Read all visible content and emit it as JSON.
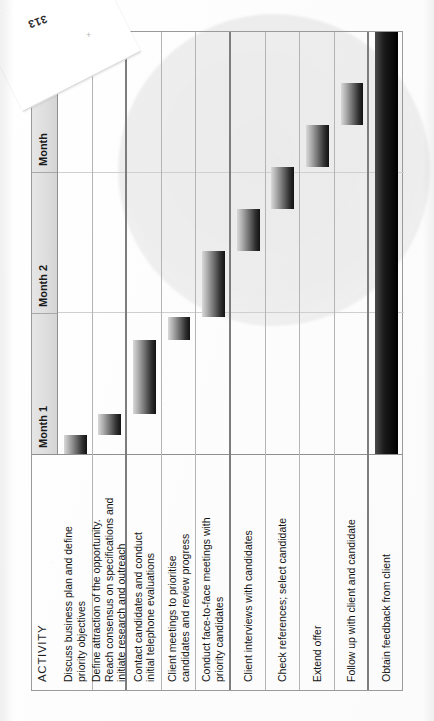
{
  "page": {
    "folio": "313",
    "registration_mark": "+"
  },
  "chart_data": {
    "type": "bar",
    "chart_kind": "gantt",
    "title": "",
    "xlabel": "",
    "ylabel": "ACTIVITY",
    "grid": true,
    "legend": "none",
    "orientation": "printed-sideways",
    "activity_header": "ACTIVITY",
    "categories": [
      "Discuss business plan and define priority objectives",
      "Define attraction of the opportunity. Reach consensus on specifications and initiate research and outreach",
      "Contact candidates and conduct initial telephone evaluations",
      "Client meetings to prioritise candidates and review progress",
      "Conduct face-to-face meetings with priority candidates",
      "Client interviews with candidates",
      "Check references; select candidate",
      "Extend offer",
      "Follow up with client and candidate",
      "Obtain feedback from client"
    ],
    "timeline_axis": {
      "tick_labels": [
        "Month 1",
        "Month 2",
        "Month"
      ],
      "months_shown": 3,
      "note": "third month label is clipped at the page edge"
    },
    "tasks": [
      {
        "id": 1,
        "label_lines": [
          "Discuss business plan and define",
          "priority objectives"
        ],
        "start_pct": 0.0,
        "end_pct": 4.5,
        "bar_style": "gradient",
        "row_divider": "thin"
      },
      {
        "id": 2,
        "label_lines": [
          "Define attraction of the opportunity.",
          "Reach consensus on specifications and",
          "initiate research and outreach"
        ],
        "start_pct": 4.5,
        "end_pct": 9.5,
        "bar_style": "gradient",
        "row_divider": "thick"
      },
      {
        "id": 3,
        "label_lines": [
          "Contact candidates and conduct",
          "initial telephone evaluations"
        ],
        "start_pct": 9.5,
        "end_pct": 27.0,
        "bar_style": "gradient",
        "row_divider": "thin"
      },
      {
        "id": 4,
        "label_lines": [
          "Client meetings to prioritise",
          "candidates and review progress"
        ],
        "start_pct": 27.0,
        "end_pct": 32.5,
        "bar_style": "gradient",
        "row_divider": "thin"
      },
      {
        "id": 5,
        "label_lines": [
          "Conduct face-to-face meetings with",
          "priority candidates"
        ],
        "start_pct": 32.5,
        "end_pct": 48.0,
        "bar_style": "gradient",
        "row_divider": "thick"
      },
      {
        "id": 6,
        "label_lines": [
          "Client interviews with candidates"
        ],
        "start_pct": 48.0,
        "end_pct": 58.0,
        "bar_style": "gradient",
        "row_divider": "thin"
      },
      {
        "id": 7,
        "label_lines": [
          "Check references; select candidate"
        ],
        "start_pct": 58.0,
        "end_pct": 68.0,
        "bar_style": "gradient",
        "row_divider": "thin"
      },
      {
        "id": 8,
        "label_lines": [
          "Extend offer"
        ],
        "start_pct": 68.0,
        "end_pct": 78.0,
        "bar_style": "gradient",
        "row_divider": "thin"
      },
      {
        "id": 9,
        "label_lines": [
          "Follow up with client and candidate"
        ],
        "start_pct": 78.0,
        "end_pct": 88.0,
        "bar_style": "gradient",
        "row_divider": "thick"
      },
      {
        "id": 10,
        "label_lines": [
          "Obtain feedback from client"
        ],
        "start_pct": 0.0,
        "end_pct": 100.0,
        "bar_style": "solid",
        "row_divider": "none"
      }
    ]
  },
  "colors": {
    "bar_dark": "#111111",
    "bar_light": "#d9d9d9",
    "grid_line": "#b4b4b4",
    "header_fill": "#e0e0e0",
    "paper": "#ffffff",
    "watermark": "#9a9a9a"
  }
}
